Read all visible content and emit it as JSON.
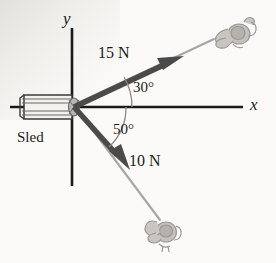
{
  "figure": {
    "kind": "free-body-force-diagram",
    "background_color": "#fbfaf8",
    "ink_color": "#1a1a1a",
    "rope_color": "#a9a6a2",
    "arc_color": "#8a8784"
  },
  "axes": {
    "x_label": "x",
    "y_label": "y",
    "origin": {
      "x": 72,
      "y": 107
    }
  },
  "object": {
    "label": "Sled",
    "name": "sled"
  },
  "forces": [
    {
      "name": "force-15n",
      "magnitude_label": "15 N",
      "magnitude": 15,
      "unit": "N",
      "angle_label": "30°",
      "angle_deg": 30,
      "direction": "above-positive-x-axis",
      "color": "#4a4a4a"
    },
    {
      "name": "force-10n",
      "magnitude_label": "10 N",
      "magnitude": 10,
      "unit": "N",
      "angle_label": "50°",
      "angle_deg": 50,
      "direction": "below-positive-x-axis",
      "color": "#4a4a4a"
    }
  ],
  "hands": [
    {
      "name": "hand-grip-upper",
      "attached_to": "force-15n"
    },
    {
      "name": "hand-grip-lower",
      "attached_to": "force-10n"
    }
  ]
}
